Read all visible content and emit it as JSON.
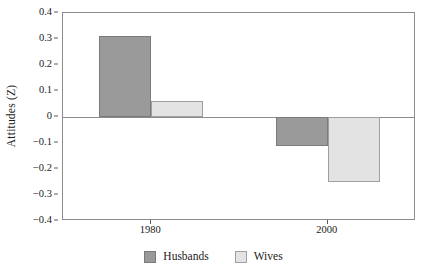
{
  "chart_data": {
    "type": "bar",
    "title": "",
    "subtitle": "",
    "xlabel": "",
    "ylabel": "Attitudes (Z)",
    "categories": [
      "1980",
      "2000"
    ],
    "series": [
      {
        "name": "Husbands",
        "color": "#9a9a9a",
        "values": [
          0.31,
          -0.11
        ]
      },
      {
        "name": "Wives",
        "color": "#e3e3e3",
        "values": [
          0.06,
          -0.25
        ]
      }
    ],
    "ylim": [
      -0.4,
      0.4
    ],
    "yticks": [
      0.4,
      0.3,
      0.2,
      0.1,
      0,
      -0.1,
      -0.2,
      -0.3,
      -0.4
    ],
    "ytick_labels": [
      "0.4",
      "0.3",
      "0.2",
      "0.1",
      "0",
      "−0.1",
      "−0.2",
      "−0.3",
      "−0.4"
    ],
    "xtick_labels": [
      "1980",
      "2000"
    ],
    "grid": false,
    "zero_line": true,
    "legend_position": "bottom-center",
    "frame": true
  },
  "legend": {
    "items": [
      {
        "label": "Husbands",
        "color": "#9a9a9a"
      },
      {
        "label": "Wives",
        "color": "#e3e3e3"
      }
    ]
  },
  "colors": {
    "husbands": "#9a9a9a",
    "wives": "#e3e3e3",
    "axis": "#8c8c8c",
    "text": "#1a1a1a",
    "background": "#ffffff"
  }
}
